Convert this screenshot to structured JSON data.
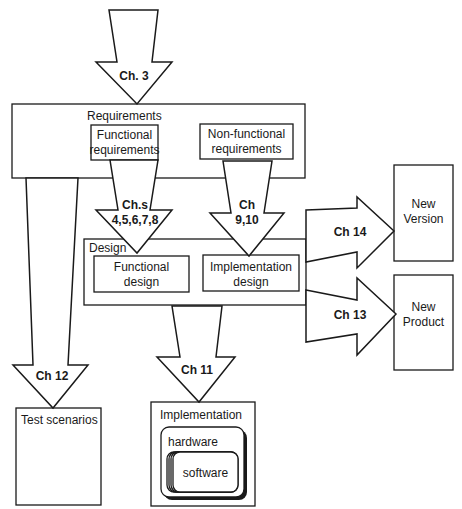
{
  "diagram": {
    "boxes": {
      "requirements": {
        "label": "Requirements"
      },
      "functional_requirements": {
        "line1": "Functional",
        "line2": "requirements"
      },
      "nonfunctional_requirements": {
        "line1": "Non-functional",
        "line2": "requirements"
      },
      "design": {
        "label": "Design"
      },
      "functional_design": {
        "line1": "Functional",
        "line2": "design"
      },
      "implementation_design": {
        "line1": "Implementation",
        "line2": "design"
      },
      "new_version": {
        "line1": "New",
        "line2": "Version"
      },
      "new_product": {
        "line1": "New",
        "line2": "Product"
      },
      "test_scenarios": {
        "label": "Test scenarios"
      },
      "implementation": {
        "label": "Implementation"
      },
      "hardware": {
        "label": "hardware"
      },
      "software": {
        "label": "software"
      }
    },
    "arrows": {
      "ch3": {
        "label": "Ch. 3"
      },
      "chs_4_8": {
        "line1": "Ch.s",
        "line2": "4,5,6,7,8"
      },
      "ch_9_10": {
        "line1": "Ch",
        "line2": "9,10"
      },
      "ch12": {
        "label": "Ch 12"
      },
      "ch11": {
        "label": "Ch 11"
      },
      "ch14": {
        "label": "Ch 14"
      },
      "ch13": {
        "label": "Ch 13"
      }
    },
    "colors": {
      "stroke": "#1a1a1a",
      "fill": "#ffffff",
      "background": "#ffffff"
    }
  }
}
